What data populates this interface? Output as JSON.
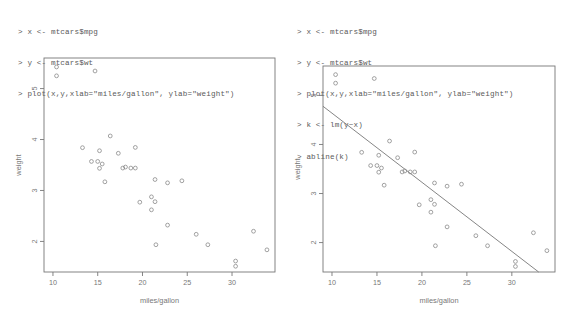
{
  "page": {
    "background": "#ffffff",
    "text_color": "#5a5a5a",
    "plot_color": "#777777"
  },
  "panels": [
    {
      "id": "left",
      "console": {
        "prompt": ">",
        "lines": [
          "> x <- mtcars$mpg",
          "> y <- mtcars$wt",
          "> plot(x,y,xlab=\"miles/gallon\", ylab=\"weight\")"
        ]
      },
      "chart_ref": 0
    },
    {
      "id": "right",
      "console": {
        "prompt": ">",
        "lines": [
          "> x <- mtcars$mpg",
          "> y <- mtcars$wt",
          "> plot(x,y,xlab=\"miles/gallon\", ylab=\"weight\")",
          "> k <- lm(y~x)",
          "> abline(k)"
        ]
      },
      "chart_ref": 1
    }
  ],
  "chart_data": [
    {
      "type": "scatter",
      "title": "",
      "xlabel": "miles/gallon",
      "ylabel": "weight",
      "xlim": [
        9.0,
        34.8
      ],
      "ylim": [
        1.4,
        5.6
      ],
      "xticks": [
        10,
        15,
        20,
        25,
        30
      ],
      "yticks": [
        2,
        3,
        4,
        5
      ],
      "grid": false,
      "legend": null,
      "marker": "open-circle",
      "marker_color": "#8a8a8a",
      "regression_line": null,
      "x": [
        21.0,
        21.0,
        22.8,
        21.4,
        18.7,
        18.1,
        14.3,
        24.4,
        22.8,
        19.2,
        17.8,
        16.4,
        17.3,
        15.2,
        10.4,
        10.4,
        14.7,
        32.4,
        30.4,
        33.9,
        21.5,
        15.5,
        15.2,
        13.3,
        19.2,
        27.3,
        26.0,
        30.4,
        15.8,
        19.7,
        15.0,
        21.4
      ],
      "y": [
        2.62,
        2.875,
        2.32,
        3.215,
        3.44,
        3.46,
        3.57,
        3.19,
        3.15,
        3.44,
        3.44,
        4.07,
        3.73,
        3.78,
        5.25,
        5.424,
        5.345,
        2.2,
        1.615,
        1.835,
        1.935,
        3.52,
        3.435,
        3.84,
        3.845,
        1.935,
        2.14,
        1.513,
        3.17,
        2.77,
        3.57,
        2.78
      ]
    },
    {
      "type": "scatter",
      "title": "",
      "xlabel": "miles/gallon",
      "ylabel": "weight",
      "xlim": [
        9.0,
        34.8
      ],
      "ylim": [
        1.4,
        5.6
      ],
      "xticks": [
        10,
        15,
        20,
        25,
        30
      ],
      "yticks": [
        2,
        3,
        4,
        5
      ],
      "grid": false,
      "legend": null,
      "marker": "open-circle",
      "marker_color": "#8a8a8a",
      "regression_line": {
        "intercept": 6.047,
        "slope": -0.1409,
        "color": "#777777",
        "label": "abline(lm(y~x))"
      },
      "x": [
        21.0,
        21.0,
        22.8,
        21.4,
        18.7,
        18.1,
        14.3,
        24.4,
        22.8,
        19.2,
        17.8,
        16.4,
        17.3,
        15.2,
        10.4,
        10.4,
        14.7,
        32.4,
        30.4,
        33.9,
        21.5,
        15.5,
        15.2,
        13.3,
        19.2,
        27.3,
        26.0,
        30.4,
        15.8,
        19.7,
        15.0,
        21.4
      ],
      "y": [
        2.62,
        2.875,
        2.32,
        3.215,
        3.44,
        3.46,
        3.57,
        3.19,
        3.15,
        3.44,
        3.44,
        4.07,
        3.73,
        3.78,
        5.25,
        5.424,
        5.345,
        2.2,
        1.615,
        1.835,
        1.935,
        3.52,
        3.435,
        3.84,
        3.845,
        1.935,
        2.14,
        1.513,
        3.17,
        2.77,
        3.57,
        2.78
      ]
    }
  ]
}
